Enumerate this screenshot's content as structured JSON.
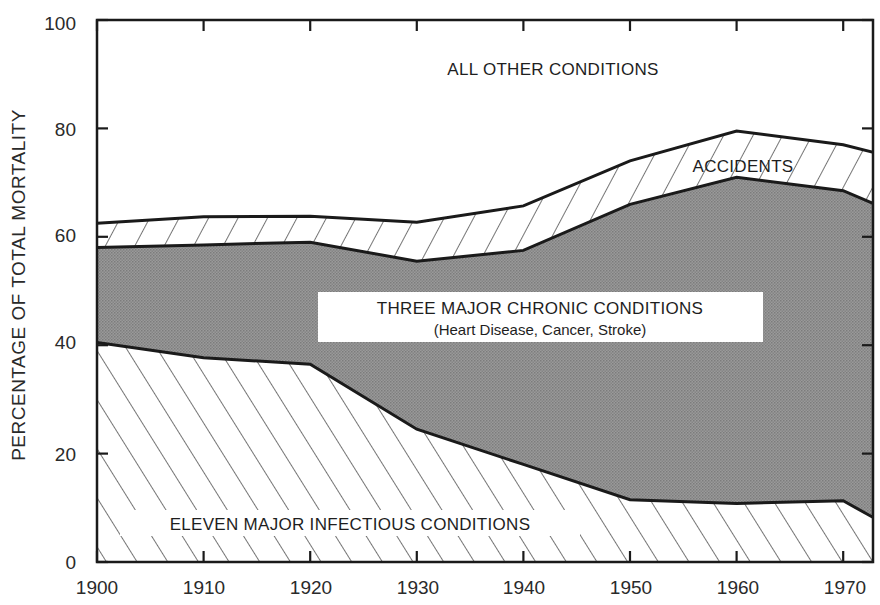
{
  "chart_data": {
    "type": "area",
    "stacked": true,
    "title": "",
    "xlabel": "",
    "ylabel": "PERCENTAGE OF TOTAL MORTALITY",
    "xlim": [
      1900,
      1973
    ],
    "ylim": [
      0,
      100
    ],
    "x_ticks": [
      1900,
      1910,
      1920,
      1930,
      1940,
      1950,
      1960,
      1970
    ],
    "y_ticks": [
      0,
      20,
      40,
      60,
      80,
      100
    ],
    "grid": false,
    "x": [
      1900,
      1910,
      1920,
      1930,
      1940,
      1950,
      1960,
      1970,
      1973
    ],
    "series": [
      {
        "name": "ELEVEN MAJOR INFECTIOUS CONDITIONS",
        "pattern": "hatch-backslash",
        "cumulative_top": [
          40.5,
          37.7,
          36.5,
          24.5,
          18.0,
          11.5,
          10.8,
          11.3,
          8.0
        ]
      },
      {
        "name": "THREE MAJOR CHRONIC CONDITIONS (Heart Disease, Cancer, Stroke)",
        "pattern": "gray-stipple",
        "cumulative_top": [
          58.0,
          58.5,
          59.0,
          55.5,
          57.5,
          66.0,
          71.0,
          68.5,
          66.0
        ]
      },
      {
        "name": "ACCIDENTS",
        "pattern": "hatch-slash",
        "cumulative_top": [
          62.5,
          63.7,
          63.8,
          62.7,
          65.7,
          74.0,
          79.5,
          77.0,
          75.5
        ]
      },
      {
        "name": "ALL OTHER CONDITIONS",
        "pattern": "white",
        "cumulative_top": [
          100,
          100,
          100,
          100,
          100,
          100,
          100,
          100,
          100
        ]
      }
    ],
    "annotations": [
      "ALL OTHER CONDITIONS",
      "ACCIDENTS",
      "THREE MAJOR CHRONIC CONDITIONS",
      "(Heart Disease, Cancer, Stroke)",
      "ELEVEN MAJOR INFECTIOUS CONDITIONS"
    ]
  },
  "labels": {
    "y_axis_title": "PERCENTAGE OF TOTAL MORTALITY",
    "all_other": "ALL OTHER CONDITIONS",
    "accidents": "ACCIDENTS",
    "chronic": "THREE MAJOR CHRONIC CONDITIONS",
    "chronic_sub": "(Heart Disease, Cancer, Stroke)",
    "infectious": "ELEVEN MAJOR INFECTIOUS CONDITIONS",
    "x_ticks": [
      "1900",
      "1910",
      "1920",
      "1930",
      "1940",
      "1950",
      "1960",
      "1970"
    ],
    "y_ticks": [
      "0",
      "20",
      "40",
      "60",
      "80",
      "100"
    ]
  },
  "colors": {
    "chronic_fill": "#8f8f8f",
    "line": "#1a1a1a",
    "hatch": "#2a2a2a",
    "background": "#ffffff"
  }
}
